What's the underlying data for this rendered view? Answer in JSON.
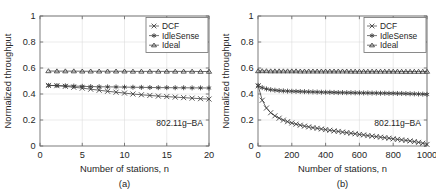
{
  "figure": {
    "background": "#ffffff",
    "axis_color": "#6e6e6e",
    "grid_color": "#d7d7d7",
    "series_color": "#3a3a3a"
  },
  "panels": [
    {
      "id": "a",
      "caption": "(a)",
      "annotation": "802.11g–BA",
      "xlabel": "Number of stations, n",
      "ylabel": "Normalized throughput",
      "legend": {
        "position": "top-right",
        "entries": [
          {
            "label": "DCF",
            "marker": "x-marker"
          },
          {
            "label": "IdleSense",
            "marker": "asterisk-marker"
          },
          {
            "label": "Ideal",
            "marker": "triangle-marker"
          }
        ]
      },
      "chart_data": {
        "type": "line",
        "title": "",
        "subtitle": "802.11g–BA",
        "xlabel": "Number of stations, n",
        "ylabel": "Normalized throughput",
        "xlim": [
          0,
          20
        ],
        "ylim": [
          0,
          1
        ],
        "xticks": [
          0,
          5,
          10,
          15,
          20
        ],
        "yticks": [
          0,
          0.2,
          0.4,
          0.6,
          0.8,
          1
        ],
        "xticklabels": [
          "0",
          "5",
          "10",
          "15",
          "20"
        ],
        "yticklabels": [
          "0",
          "0.2",
          "0.4",
          "0.6",
          "0.8",
          "1"
        ],
        "grid": true,
        "legend_position": "upper right",
        "x": [
          1,
          2,
          3,
          4,
          5,
          6,
          7,
          8,
          9,
          10,
          11,
          12,
          13,
          14,
          15,
          16,
          17,
          18,
          19,
          20
        ],
        "series": [
          {
            "name": "DCF",
            "marker": "x",
            "values": [
              0.466,
              0.464,
              0.459,
              0.452,
              0.445,
              0.437,
              0.429,
              0.421,
              0.414,
              0.407,
              0.4,
              0.394,
              0.389,
              0.384,
              0.38,
              0.376,
              0.372,
              0.368,
              0.364,
              0.361
            ]
          },
          {
            "name": "IdleSense",
            "marker": "*",
            "values": [
              0.466,
              0.465,
              0.463,
              0.461,
              0.459,
              0.457,
              0.456,
              0.455,
              0.454,
              0.453,
              0.452,
              0.451,
              0.45,
              0.449,
              0.449,
              0.448,
              0.448,
              0.447,
              0.447,
              0.446
            ]
          },
          {
            "name": "Ideal",
            "marker": "triangle",
            "values": [
              0.577,
              0.576,
              0.576,
              0.576,
              0.575,
              0.575,
              0.575,
              0.575,
              0.575,
              0.575,
              0.574,
              0.574,
              0.574,
              0.574,
              0.574,
              0.574,
              0.574,
              0.574,
              0.573,
              0.573
            ]
          }
        ]
      }
    },
    {
      "id": "b",
      "caption": "(b)",
      "annotation": "802.11g–BA",
      "xlabel": "Number of stations, n",
      "ylabel": "Normalized throughput",
      "legend": {
        "position": "top-right",
        "entries": [
          {
            "label": "DCF",
            "marker": "x-marker"
          },
          {
            "label": "IdleSense",
            "marker": "asterisk-marker"
          },
          {
            "label": "Ideal",
            "marker": "triangle-marker"
          }
        ]
      },
      "chart_data": {
        "type": "line",
        "title": "",
        "subtitle": "802.11g–BA",
        "xlabel": "Number of stations, n",
        "ylabel": "Normalized throughput",
        "xlim": [
          0,
          1000
        ],
        "ylim": [
          0,
          1
        ],
        "xticks": [
          0,
          200,
          400,
          600,
          800,
          1000
        ],
        "yticks": [
          0,
          0.2,
          0.4,
          0.6,
          0.8,
          1
        ],
        "xticklabels": [
          "0",
          "200",
          "400",
          "600",
          "800",
          "1000"
        ],
        "yticklabels": [
          "0",
          "0.2",
          "0.4",
          "0.6",
          "0.8",
          "1"
        ],
        "grid": true,
        "legend_position": "upper right",
        "x": [
          1,
          25,
          50,
          75,
          100,
          125,
          150,
          175,
          200,
          225,
          250,
          275,
          300,
          325,
          350,
          375,
          400,
          425,
          450,
          475,
          500,
          525,
          550,
          575,
          600,
          625,
          650,
          675,
          700,
          725,
          750,
          775,
          800,
          825,
          850,
          875,
          900,
          925,
          950,
          975,
          1000
        ],
        "series": [
          {
            "name": "DCF",
            "marker": "x",
            "values": [
              0.463,
              0.352,
              0.292,
              0.256,
              0.232,
              0.214,
              0.199,
              0.187,
              0.177,
              0.168,
              0.16,
              0.153,
              0.147,
              0.141,
              0.136,
              0.131,
              0.126,
              0.121,
              0.116,
              0.112,
              0.107,
              0.103,
              0.098,
              0.094,
              0.089,
              0.085,
              0.08,
              0.076,
              0.072,
              0.068,
              0.064,
              0.06,
              0.055,
              0.051,
              0.047,
              0.043,
              0.039,
              0.034,
              0.028,
              0.021,
              0.012
            ]
          },
          {
            "name": "IdleSense",
            "marker": "*",
            "values": [
              0.466,
              0.449,
              0.439,
              0.433,
              0.429,
              0.426,
              0.424,
              0.422,
              0.421,
              0.42,
              0.419,
              0.418,
              0.417,
              0.416,
              0.415,
              0.414,
              0.413,
              0.413,
              0.412,
              0.411,
              0.411,
              0.41,
              0.41,
              0.409,
              0.409,
              0.408,
              0.408,
              0.407,
              0.407,
              0.406,
              0.406,
              0.405,
              0.405,
              0.404,
              0.404,
              0.403,
              0.402,
              0.401,
              0.4,
              0.399,
              0.397
            ]
          },
          {
            "name": "Ideal",
            "marker": "triangle",
            "values": [
              0.577,
              0.577,
              0.577,
              0.576,
              0.576,
              0.576,
              0.576,
              0.576,
              0.576,
              0.576,
              0.575,
              0.575,
              0.575,
              0.575,
              0.575,
              0.575,
              0.575,
              0.575,
              0.575,
              0.575,
              0.575,
              0.575,
              0.574,
              0.574,
              0.574,
              0.574,
              0.574,
              0.574,
              0.574,
              0.574,
              0.574,
              0.574,
              0.574,
              0.574,
              0.573,
              0.573,
              0.573,
              0.573,
              0.573,
              0.573,
              0.573
            ]
          }
        ]
      }
    }
  ]
}
